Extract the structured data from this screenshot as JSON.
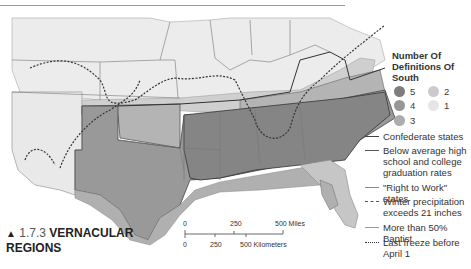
{
  "figure": {
    "marker": "▲",
    "number": "1.7.3",
    "title_line1": "VERNACULAR",
    "title_line2": "REGIONS"
  },
  "legend": {
    "title": "Number Of Definitions Of South",
    "levels": [
      {
        "value": "5",
        "color": "#7d7d7d"
      },
      {
        "value": "4",
        "color": "#979797"
      },
      {
        "value": "3",
        "color": "#adadad"
      },
      {
        "value": "2",
        "color": "#cbcbcb"
      },
      {
        "value": "1",
        "color": "#e6e6e6"
      }
    ],
    "lines": [
      {
        "label": "Confederate states",
        "style": "solid",
        "color": "#444444"
      },
      {
        "label": "Below average high school and college graduation rates",
        "style": "solid",
        "color": "#555555"
      },
      {
        "label": "\"Right to Work\" states",
        "style": "solid",
        "color": "#8a8a8a"
      },
      {
        "label": "Winter precipitation exceeds 21 inches",
        "style": "dashed",
        "color": "#555555"
      },
      {
        "label": "More than 50% Baptist",
        "style": "solid",
        "color": "#999999"
      },
      {
        "label": "Last freeze before April 1",
        "style": "dotted",
        "color": "#333333"
      }
    ]
  },
  "scale_bar": {
    "miles": [
      "0",
      "250",
      "500 Miles"
    ],
    "kilometers": [
      "0",
      "250",
      "500 Kilometers"
    ]
  }
}
